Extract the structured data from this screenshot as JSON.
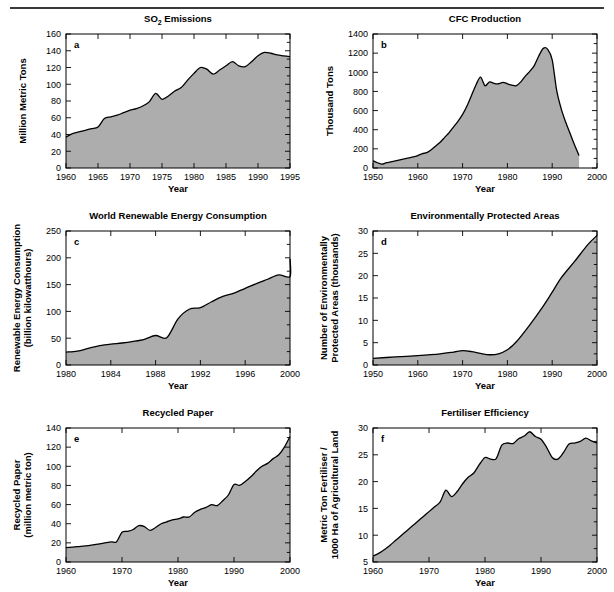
{
  "figure": {
    "divider_color": "#3a3a3a",
    "fill_color": "#adadad",
    "line_color": "#000000",
    "panel_letters": [
      "a",
      "b",
      "c",
      "d",
      "e",
      "f"
    ]
  },
  "chart_data": [
    {
      "id": "so2-emissions",
      "panel": "a",
      "type": "area",
      "title": "SO₂ Emissions",
      "xlabel": "Year",
      "ylabel": "Million Metric Tons",
      "ylabel_lines": [
        "Million Metric Tons"
      ],
      "xlim": [
        1960,
        1995
      ],
      "ylim": [
        0,
        160
      ],
      "xticks": [
        1960,
        1965,
        1970,
        1975,
        1980,
        1985,
        1990,
        1995
      ],
      "yticks": [
        0,
        20,
        40,
        60,
        80,
        100,
        120,
        140,
        160
      ],
      "grid": false,
      "legend": "none",
      "x": [
        1960,
        1961,
        1962,
        1963,
        1964,
        1965,
        1966,
        1967,
        1968,
        1969,
        1970,
        1971,
        1972,
        1973,
        1974,
        1975,
        1976,
        1977,
        1978,
        1979,
        1980,
        1981,
        1982,
        1983,
        1984,
        1985,
        1986,
        1987,
        1988,
        1989,
        1990,
        1991,
        1992,
        1993,
        1994,
        1995
      ],
      "values": [
        37,
        41,
        43,
        45,
        47,
        49,
        59,
        61,
        63,
        66,
        69,
        71,
        74,
        79,
        89,
        82,
        86,
        92,
        96,
        105,
        113,
        120,
        118,
        112,
        117,
        122,
        127,
        122,
        121,
        127,
        134,
        138,
        137,
        135,
        134,
        133
      ]
    },
    {
      "id": "cfc-production",
      "panel": "b",
      "type": "area",
      "title": "CFC Production",
      "xlabel": "Year",
      "ylabel": "Thousand Tons",
      "ylabel_lines": [
        "Thousand Tons"
      ],
      "xlim": [
        1950,
        2000
      ],
      "ylim": [
        0,
        1400
      ],
      "xticks": [
        1950,
        1960,
        1970,
        1980,
        1990,
        2000
      ],
      "yticks": [
        0,
        200,
        400,
        600,
        800,
        1000,
        1200,
        1400
      ],
      "grid": false,
      "legend": "none",
      "x": [
        1950,
        1951,
        1952,
        1953,
        1954,
        1955,
        1956,
        1957,
        1958,
        1959,
        1960,
        1961,
        1962,
        1963,
        1964,
        1965,
        1966,
        1967,
        1968,
        1969,
        1970,
        1971,
        1972,
        1973,
        1974,
        1975,
        1976,
        1977,
        1978,
        1979,
        1980,
        1981,
        1982,
        1983,
        1984,
        1985,
        1986,
        1987,
        1988,
        1989,
        1990,
        1991,
        1992,
        1993,
        1994,
        1995,
        1996
      ],
      "values": [
        75,
        55,
        40,
        55,
        65,
        75,
        85,
        95,
        105,
        115,
        130,
        150,
        160,
        190,
        230,
        270,
        320,
        370,
        430,
        490,
        560,
        650,
        760,
        870,
        950,
        860,
        900,
        885,
        880,
        895,
        880,
        865,
        860,
        900,
        960,
        1010,
        1070,
        1170,
        1250,
        1240,
        1130,
        810,
        620,
        480,
        360,
        240,
        130
      ]
    },
    {
      "id": "world-renewable-energy-consumption",
      "panel": "c",
      "type": "area",
      "title": "World Renewable Energy Consumption",
      "xlabel": "Year",
      "ylabel": "Renewable Energy Consumption (billion kilowatthours)",
      "ylabel_lines": [
        "Renewable Energy Consumption",
        "(billion kilowatthours)"
      ],
      "xlim": [
        1980,
        2000
      ],
      "ylim": [
        0,
        250
      ],
      "xticks": [
        1980,
        1984,
        1988,
        1992,
        1996,
        2000
      ],
      "yticks": [
        0,
        50,
        100,
        150,
        200,
        250
      ],
      "grid": false,
      "legend": "none",
      "x": [
        1980,
        1981,
        1982,
        1983,
        1984,
        1985,
        1986,
        1987,
        1988,
        1989,
        1990,
        1991,
        1992,
        1993,
        1994,
        1995,
        1996,
        1997,
        1998,
        1999,
        2000
      ],
      "values": [
        24,
        26,
        31,
        36,
        39,
        41,
        44,
        48,
        55,
        51,
        86,
        104,
        107,
        118,
        128,
        134,
        143,
        152,
        160,
        168,
        165
      ],
      "values_tail": [
        198
      ],
      "x_tail": [
        2000
      ]
    },
    {
      "id": "environmentally-protected-areas",
      "panel": "d",
      "type": "area",
      "title": "Environmentally Protected Areas",
      "xlabel": "Year",
      "ylabel": "Number of Environmentally Protected Areas (thousands)",
      "ylabel_lines": [
        "Number of Environmentally",
        "Protected Areas (thousands)"
      ],
      "xlim": [
        1950,
        2000
      ],
      "ylim": [
        0,
        30
      ],
      "xticks": [
        1950,
        1960,
        1970,
        1980,
        1990,
        2000
      ],
      "yticks": [
        0,
        5,
        10,
        15,
        20,
        25,
        30
      ],
      "grid": false,
      "legend": "none",
      "x": [
        1950,
        1955,
        1960,
        1965,
        1968,
        1970,
        1972,
        1974,
        1976,
        1978,
        1980,
        1982,
        1985,
        1988,
        1990,
        1992,
        1995,
        1998,
        2000
      ],
      "values": [
        1.5,
        1.8,
        2.1,
        2.5,
        2.9,
        3.2,
        3.0,
        2.6,
        2.3,
        2.5,
        3.4,
        5.2,
        9.0,
        13.2,
        16.3,
        19.5,
        23.2,
        27.0,
        29.0
      ]
    },
    {
      "id": "recycled-paper",
      "panel": "e",
      "type": "area",
      "title": "Recycled Paper",
      "xlabel": "Year",
      "ylabel": "Recycled Paper (million metric ton)",
      "ylabel_lines": [
        "Recycled Paper",
        "(million metric ton)"
      ],
      "xlim": [
        1960,
        2000
      ],
      "ylim": [
        0,
        140
      ],
      "xticks": [
        1960,
        1970,
        1980,
        1990,
        2000
      ],
      "yticks": [
        0,
        20,
        40,
        60,
        80,
        100,
        120,
        140
      ],
      "grid": false,
      "legend": "none",
      "x": [
        1960,
        1962,
        1964,
        1966,
        1968,
        1969,
        1970,
        1971,
        1972,
        1973,
        1974,
        1975,
        1976,
        1977,
        1978,
        1979,
        1980,
        1981,
        1982,
        1983,
        1984,
        1985,
        1986,
        1987,
        1988,
        1989,
        1990,
        1991,
        1992,
        1993,
        1994,
        1995,
        1996,
        1997,
        1998,
        1999,
        2000
      ],
      "values": [
        15,
        16,
        17,
        19,
        21,
        21,
        31,
        32,
        34,
        38,
        37,
        33,
        36,
        40,
        42,
        44,
        45,
        47,
        47,
        52,
        55,
        57,
        60,
        59,
        64,
        70,
        81,
        80,
        84,
        89,
        95,
        100,
        103,
        108,
        112,
        120,
        131
      ]
    },
    {
      "id": "fertiliser-efficiency",
      "panel": "f",
      "type": "area",
      "title": "Fertiliser Efficiency",
      "xlabel": "Year",
      "ylabel": "Metric Ton Fertiliser / 1000 Ha of Agricultural Land",
      "ylabel_lines": [
        "Metric Ton Fertiliser /",
        "1000 Ha of Agricultural Land"
      ],
      "xlim": [
        1960,
        2000
      ],
      "ylim": [
        5,
        30
      ],
      "xticks": [
        1960,
        1970,
        1980,
        1990,
        2000
      ],
      "yticks": [
        5,
        10,
        15,
        20,
        25,
        30
      ],
      "grid": false,
      "legend": "none",
      "x": [
        1960,
        1961,
        1962,
        1963,
        1964,
        1965,
        1966,
        1967,
        1968,
        1969,
        1970,
        1971,
        1972,
        1973,
        1974,
        1975,
        1976,
        1977,
        1978,
        1979,
        1980,
        1981,
        1982,
        1983,
        1984,
        1985,
        1986,
        1987,
        1988,
        1989,
        1990,
        1991,
        1992,
        1993,
        1994,
        1995,
        1996,
        1997,
        1998,
        1999,
        2000
      ],
      "values": [
        6.1,
        6.6,
        7.3,
        8.1,
        9.0,
        9.9,
        10.8,
        11.7,
        12.6,
        13.5,
        14.4,
        15.3,
        16.2,
        18.4,
        17.2,
        18.1,
        19.6,
        20.8,
        21.6,
        23.2,
        24.5,
        24.2,
        24.3,
        26.8,
        27.2,
        27.1,
        28.0,
        28.5,
        29.3,
        28.4,
        27.9,
        26.4,
        24.5,
        24.2,
        25.4,
        27.0,
        27.2,
        27.5,
        28.1,
        27.6,
        27.2
      ]
    }
  ]
}
